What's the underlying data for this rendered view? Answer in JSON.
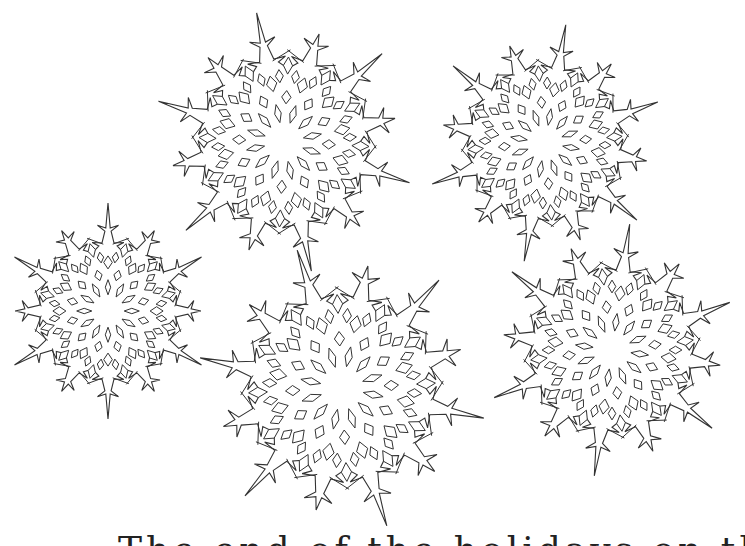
{
  "page": {
    "caption": "The end of the holidays on the north"
  },
  "style": {
    "background": "#ffffff",
    "stroke": "#333333",
    "fill": "#ffffff"
  },
  "snowflakes": [
    {
      "name": "snowflake-top-left",
      "cx": 284,
      "cy": 142,
      "r": 132,
      "rotation": -12
    },
    {
      "name": "snowflake-top-right",
      "cx": 545,
      "cy": 143,
      "r": 120,
      "rotation": 10
    },
    {
      "name": "snowflake-middle-left",
      "cx": 108,
      "cy": 311,
      "r": 108,
      "rotation": 0
    },
    {
      "name": "snowflake-bottom-center",
      "cx": 342,
      "cy": 388,
      "r": 145,
      "rotation": -18
    },
    {
      "name": "snowflake-bottom-right",
      "cx": 612,
      "cy": 350,
      "r": 127,
      "rotation": 8
    }
  ]
}
